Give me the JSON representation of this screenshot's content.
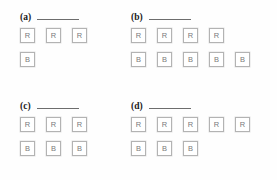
{
  "worksheet": {
    "background_color": "#fefefe",
    "box_border_color": "#b3b3b3",
    "letter_color": "#7a7a7a",
    "label_color": "#1a1a1a",
    "blank_line_color": "#6d6d6d",
    "panels": [
      {
        "id": "a",
        "label": "(a)",
        "answer_value": "",
        "rows": [
          {
            "letter": "R",
            "count": 3,
            "cells": [
              "R",
              "R",
              "R"
            ]
          },
          {
            "letter": "B",
            "count": 1,
            "cells": [
              "B"
            ]
          }
        ]
      },
      {
        "id": "b",
        "label": "(b)",
        "answer_value": "",
        "rows": [
          {
            "letter": "R",
            "count": 4,
            "cells": [
              "R",
              "R",
              "R",
              "R"
            ]
          },
          {
            "letter": "B",
            "count": 5,
            "cells": [
              "B",
              "B",
              "B",
              "B",
              "B"
            ]
          }
        ]
      },
      {
        "id": "c",
        "label": "(c)",
        "answer_value": "",
        "rows": [
          {
            "letter": "R",
            "count": 3,
            "cells": [
              "R",
              "R",
              "R"
            ]
          },
          {
            "letter": "B",
            "count": 3,
            "cells": [
              "B",
              "B",
              "B"
            ]
          }
        ]
      },
      {
        "id": "d",
        "label": "(d)",
        "answer_value": "",
        "rows": [
          {
            "letter": "R",
            "count": 5,
            "cells": [
              "R",
              "R",
              "R",
              "R",
              "R"
            ]
          },
          {
            "letter": "B",
            "count": 3,
            "cells": [
              "B",
              "B",
              "B"
            ]
          }
        ]
      }
    ]
  }
}
